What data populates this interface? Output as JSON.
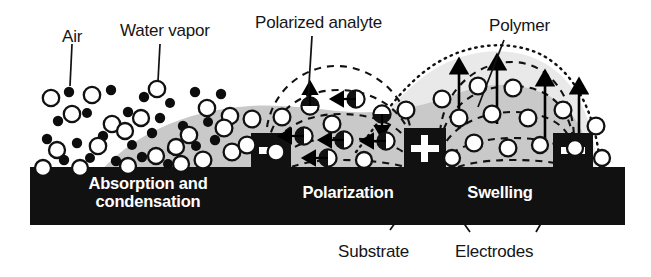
{
  "figure": {
    "kind": "humidity-sensor-mechanism-schematic",
    "background_color": "#ffffff",
    "ink_color": "#000000",
    "polymer_fill_color": "#c9c9c9",
    "polymer_swollen_fill_color": "#e6e6e6",
    "substrate_color": "#111111",
    "electrode_color": "#111111"
  },
  "callout_labels": [
    {
      "id": "air",
      "text": "Air",
      "x": 62,
      "y": 28
    },
    {
      "id": "water-vapor",
      "text": "Water vapor",
      "x": 120,
      "y": 22
    },
    {
      "id": "polarized-analyte",
      "text": "Polarized analyte",
      "x": 255,
      "y": 14
    },
    {
      "id": "polymer",
      "text": "Polymer",
      "x": 489,
      "y": 17
    },
    {
      "id": "substrate",
      "text": "Substrate",
      "x": 338,
      "y": 243
    },
    {
      "id": "electrodes",
      "text": "Electrodes",
      "x": 455,
      "y": 243
    }
  ],
  "stage_labels": [
    {
      "id": "absorption-condensation",
      "line1": "Absorption and",
      "line2": "condensation",
      "cx": 148,
      "cy": 185
    },
    {
      "id": "polarization",
      "line1": "Polarization",
      "line2": "",
      "cx": 348,
      "cy": 192
    },
    {
      "id": "swelling",
      "line1": "Swelling",
      "line2": "",
      "cx": 500,
      "cy": 192
    }
  ],
  "electrodes": [
    {
      "id": "electrode-left",
      "polarity": "-",
      "x": 251,
      "y": 133,
      "w": 40,
      "h": 36
    },
    {
      "id": "electrode-center",
      "polarity": "+",
      "x": 404,
      "y": 128,
      "w": 42,
      "h": 41
    },
    {
      "id": "electrode-right",
      "polarity": "-",
      "x": 553,
      "y": 133,
      "w": 40,
      "h": 36
    }
  ],
  "substrate": {
    "x": 30,
    "y": 167,
    "w": 595,
    "h": 58
  },
  "legend_semantics": {
    "air_marker": "small-filled-black-dot",
    "water_vapor_marker": "open-circle-black-outline",
    "polarized_analyte_marker": "circle-with-internal-dipole-arrow",
    "field_lines": "dashed-arcs-between-electrodes",
    "swelling_arrows": "upward-solid-arrows",
    "swollen-boundary": "dotted-outline"
  }
}
